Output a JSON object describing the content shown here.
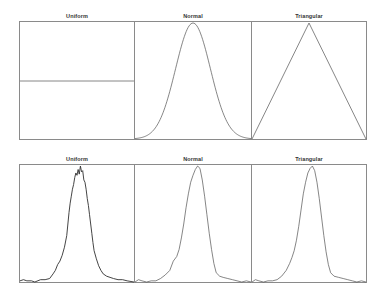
{
  "colors": {
    "frame": "#8a8a8a",
    "line": "#555555",
    "line_dark": "#333333",
    "background": "#ffffff"
  },
  "chart_data": [
    {
      "type": "line",
      "row": "top",
      "title": "Uniform",
      "xlabel": "",
      "ylabel": "",
      "grid": false,
      "series": [
        {
          "name": "Uniform density",
          "points": [
            [
              0,
              0.5
            ],
            [
              1,
              0.5
            ]
          ]
        }
      ],
      "xlim": [
        0,
        1
      ],
      "ylim": [
        0,
        1
      ]
    },
    {
      "type": "line",
      "row": "top",
      "title": "Normal",
      "xlabel": "",
      "ylabel": "",
      "grid": false,
      "series": [
        {
          "name": "Normal density",
          "mean": 0.5,
          "sigma": 0.15,
          "peak": 1.0
        }
      ],
      "xlim": [
        0,
        1
      ],
      "ylim": [
        0,
        1
      ]
    },
    {
      "type": "line",
      "row": "top",
      "title": "Triangular",
      "xlabel": "",
      "ylabel": "",
      "grid": false,
      "series": [
        {
          "name": "Triangular density",
          "points": [
            [
              0,
              0
            ],
            [
              0.5,
              1
            ],
            [
              1,
              0
            ]
          ]
        }
      ],
      "xlim": [
        0,
        1
      ],
      "ylim": [
        0,
        1
      ]
    },
    {
      "type": "line",
      "row": "bottom",
      "title": "Uniform",
      "xlabel": "",
      "ylabel": "",
      "grid": false,
      "series": [
        {
          "name": "Uniform result histogram",
          "points": [
            [
              0,
              0.01
            ],
            [
              0.03,
              0.02
            ],
            [
              0.06,
              0.01
            ],
            [
              0.1,
              0.01
            ],
            [
              0.13,
              0.0
            ],
            [
              0.18,
              0.02
            ],
            [
              0.22,
              0.02
            ],
            [
              0.26,
              0.03
            ],
            [
              0.29,
              0.07
            ],
            [
              0.31,
              0.1
            ],
            [
              0.33,
              0.15
            ],
            [
              0.35,
              0.18
            ],
            [
              0.37,
              0.23
            ],
            [
              0.39,
              0.3
            ],
            [
              0.41,
              0.4
            ],
            [
              0.42,
              0.5
            ],
            [
              0.43,
              0.6
            ],
            [
              0.44,
              0.68
            ],
            [
              0.45,
              0.74
            ],
            [
              0.46,
              0.8
            ],
            [
              0.47,
              0.84
            ],
            [
              0.48,
              0.9
            ],
            [
              0.49,
              0.94
            ],
            [
              0.5,
              0.92
            ],
            [
              0.51,
              0.97
            ],
            [
              0.52,
              0.93
            ],
            [
              0.53,
              1.0
            ],
            [
              0.54,
              0.95
            ],
            [
              0.55,
              0.96
            ],
            [
              0.56,
              0.88
            ],
            [
              0.57,
              0.86
            ],
            [
              0.58,
              0.8
            ],
            [
              0.59,
              0.72
            ],
            [
              0.6,
              0.66
            ],
            [
              0.61,
              0.58
            ],
            [
              0.62,
              0.5
            ],
            [
              0.63,
              0.42
            ],
            [
              0.64,
              0.34
            ],
            [
              0.65,
              0.27
            ],
            [
              0.67,
              0.2
            ],
            [
              0.69,
              0.14
            ],
            [
              0.71,
              0.1
            ],
            [
              0.73,
              0.07
            ],
            [
              0.76,
              0.05
            ],
            [
              0.79,
              0.04
            ],
            [
              0.82,
              0.03
            ],
            [
              0.86,
              0.02
            ],
            [
              0.9,
              0.02
            ],
            [
              0.94,
              0.01
            ],
            [
              1,
              0.0
            ]
          ]
        }
      ],
      "xlim": [
        0,
        1
      ],
      "ylim": [
        0,
        1
      ]
    },
    {
      "type": "line",
      "row": "bottom",
      "title": "Normal",
      "xlabel": "",
      "ylabel": "",
      "grid": false,
      "series": [
        {
          "name": "Normal result histogram",
          "points": [
            [
              0,
              0.0
            ],
            [
              0.03,
              0.02
            ],
            [
              0.06,
              0.01
            ],
            [
              0.1,
              0.0
            ],
            [
              0.14,
              0.01
            ],
            [
              0.18,
              0.01
            ],
            [
              0.22,
              0.03
            ],
            [
              0.26,
              0.06
            ],
            [
              0.3,
              0.1
            ],
            [
              0.33,
              0.18
            ],
            [
              0.36,
              0.22
            ],
            [
              0.38,
              0.28
            ],
            [
              0.4,
              0.38
            ],
            [
              0.42,
              0.5
            ],
            [
              0.44,
              0.64
            ],
            [
              0.46,
              0.76
            ],
            [
              0.48,
              0.86
            ],
            [
              0.5,
              0.92
            ],
            [
              0.52,
              0.97
            ],
            [
              0.54,
              1.0
            ],
            [
              0.56,
              0.98
            ],
            [
              0.58,
              0.88
            ],
            [
              0.6,
              0.74
            ],
            [
              0.62,
              0.58
            ],
            [
              0.64,
              0.42
            ],
            [
              0.66,
              0.28
            ],
            [
              0.68,
              0.16
            ],
            [
              0.7,
              0.08
            ],
            [
              0.73,
              0.05
            ],
            [
              0.76,
              0.04
            ],
            [
              0.8,
              0.03
            ],
            [
              0.84,
              0.02
            ],
            [
              0.88,
              0.01
            ],
            [
              0.92,
              0.0
            ],
            [
              0.96,
              0.01
            ],
            [
              1,
              0.0
            ]
          ]
        }
      ],
      "xlim": [
        0,
        1
      ],
      "ylim": [
        0,
        1
      ]
    },
    {
      "type": "line",
      "row": "bottom",
      "title": "Triangular",
      "xlabel": "",
      "ylabel": "",
      "grid": false,
      "series": [
        {
          "name": "Triangular result histogram",
          "points": [
            [
              0,
              0.0
            ],
            [
              0.03,
              0.02
            ],
            [
              0.06,
              0.01
            ],
            [
              0.1,
              0.0
            ],
            [
              0.14,
              0.01
            ],
            [
              0.18,
              0.01
            ],
            [
              0.22,
              0.02
            ],
            [
              0.26,
              0.05
            ],
            [
              0.3,
              0.1
            ],
            [
              0.33,
              0.16
            ],
            [
              0.35,
              0.21
            ],
            [
              0.37,
              0.27
            ],
            [
              0.39,
              0.36
            ],
            [
              0.41,
              0.48
            ],
            [
              0.43,
              0.62
            ],
            [
              0.45,
              0.76
            ],
            [
              0.47,
              0.86
            ],
            [
              0.49,
              0.94
            ],
            [
              0.51,
              0.98
            ],
            [
              0.53,
              1.0
            ],
            [
              0.55,
              0.96
            ],
            [
              0.57,
              0.86
            ],
            [
              0.59,
              0.72
            ],
            [
              0.61,
              0.56
            ],
            [
              0.63,
              0.4
            ],
            [
              0.65,
              0.26
            ],
            [
              0.67,
              0.15
            ],
            [
              0.69,
              0.08
            ],
            [
              0.72,
              0.05
            ],
            [
              0.76,
              0.04
            ],
            [
              0.8,
              0.03
            ],
            [
              0.84,
              0.02
            ],
            [
              0.88,
              0.01
            ],
            [
              0.92,
              0.0
            ],
            [
              0.96,
              0.01
            ],
            [
              1,
              0.0
            ]
          ]
        }
      ],
      "xlim": [
        0,
        1
      ],
      "ylim": [
        0,
        1
      ]
    }
  ],
  "panels": {
    "top": [
      {
        "title": "Uniform"
      },
      {
        "title": "Normal"
      },
      {
        "title": "Triangular"
      }
    ],
    "bottom": [
      {
        "title": "Uniform"
      },
      {
        "title": "Normal"
      },
      {
        "title": "Triangular"
      }
    ]
  }
}
